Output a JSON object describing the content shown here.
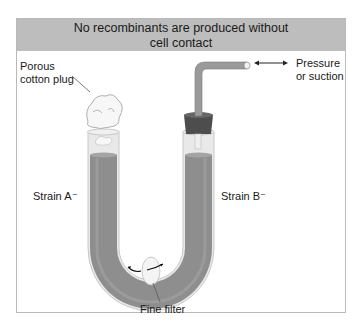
{
  "diagram": {
    "title_line1": "No recombinants are produced without",
    "title_line2": "cell contact",
    "labels": {
      "plug_line1": "Porous",
      "plug_line2": "cotton plug",
      "pressure_line1": "Pressure",
      "pressure_line2": "or suction",
      "strain_a": "Strain A⁻",
      "strain_b": "Strain B⁻",
      "filter": "Fine filter"
    },
    "icons": [
      "u-tube-icon",
      "cotton-plug-icon",
      "rubber-stopper-icon",
      "bent-tube-icon",
      "double-arrow-icon",
      "filter-disc-icon"
    ],
    "colors": {
      "title_bg": "#bdbdbd",
      "liquid": "#8e8e8e",
      "glass": "#e6e6e6",
      "stopper": "#4d4d4d",
      "border": "#b9b9b9"
    }
  }
}
